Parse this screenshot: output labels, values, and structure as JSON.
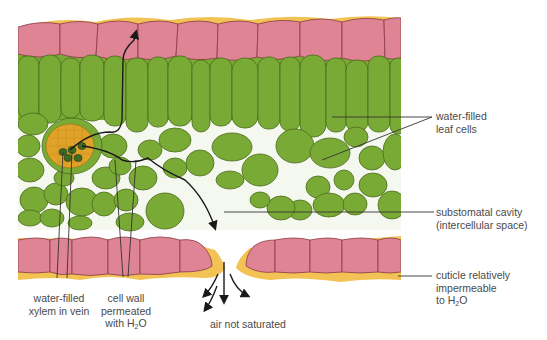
{
  "diagram": {
    "colors": {
      "cuticle": "#f2c255",
      "epidermis": "#de8494",
      "mesophyll": "#7aaa36",
      "cell_outline": "#4a6a1c",
      "xylem": "#e0a32a",
      "vein_core": "#3f6a22",
      "arrow": "#1a1a1a",
      "leader_line": "#333333",
      "text": "#4a4a4a"
    },
    "labels": {
      "leaf_cells": {
        "line1": "water-filled",
        "line2": "leaf cells"
      },
      "substomatal": {
        "line1": "substomatal cavity",
        "line2": "(intercellular space)"
      },
      "cuticle": {
        "line1": "cuticle relatively",
        "line2": "impermeable",
        "line3_prefix": "to H",
        "line3_sub": "2",
        "line3_suffix": "O"
      },
      "xylem": {
        "line1": "water-filled",
        "line2": "xylem in vein"
      },
      "cell_wall": {
        "line1": "cell wall",
        "line2": "permeated",
        "line3_prefix": "with H",
        "line3_sub": "2",
        "line3_suffix": "O"
      },
      "air": {
        "text": "air not saturated"
      }
    }
  }
}
